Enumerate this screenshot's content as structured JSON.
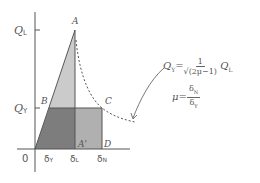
{
  "diagram": {
    "y_axis_labels": {
      "ql": "QL",
      "qv": "QY"
    },
    "x_axis_labels": {
      "origin": "0",
      "dv": "δY",
      "dl": "δL",
      "dn": "δN"
    },
    "points": {
      "a": "A",
      "b": "B",
      "c": "C",
      "d": "D",
      "a_prime": "A'"
    },
    "equation_qv": {
      "lhs": "QY",
      "eq": "=",
      "numerator": "1",
      "denominator": "√(2μ−1)",
      "rhs": "QL"
    },
    "equation_mu": {
      "lhs": "μ",
      "eq": "=",
      "numerator": "δN",
      "denominator": "δY"
    },
    "colors": {
      "light_fill": "#c8c8c8",
      "mid_fill": "#a8a8a8",
      "dark_fill": "#7a7a7a",
      "line": "#555555"
    }
  }
}
